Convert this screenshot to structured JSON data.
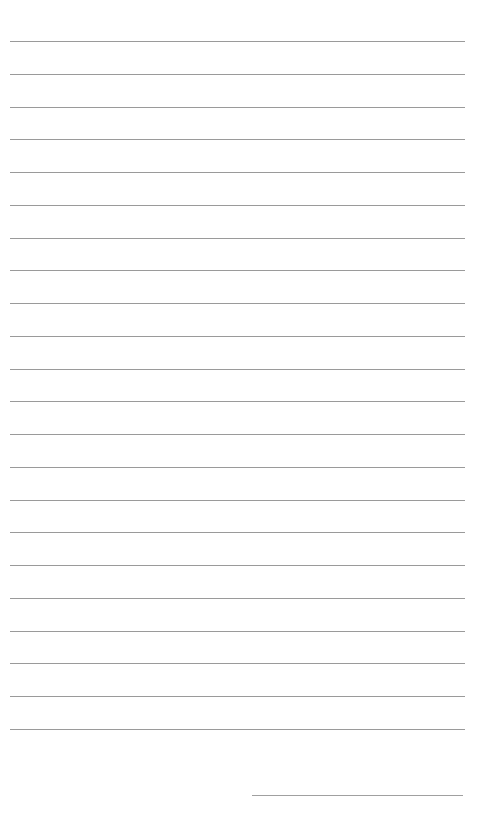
{
  "page": {
    "type": "lined-paper",
    "background": "#ffffff",
    "line_color": "#9a9a9a",
    "line_count": 22,
    "first_line_y": 41,
    "line_spacing": 32.76,
    "signature_line": {
      "present": true
    }
  }
}
